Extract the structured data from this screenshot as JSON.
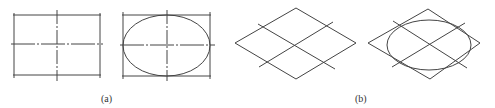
{
  "figure": {
    "labels": {
      "a": "(a)",
      "b": "(b)"
    },
    "stroke_color": "#444444",
    "panels": [
      {
        "id": "a-left",
        "shape": "rectangle with center lines"
      },
      {
        "id": "a-right",
        "shape": "rectangle with inscribed ellipse and center lines"
      },
      {
        "id": "b-left",
        "shape": "rhombus with center lines"
      },
      {
        "id": "b-right",
        "shape": "rhombus with inscribed ellipse and center lines"
      }
    ]
  }
}
